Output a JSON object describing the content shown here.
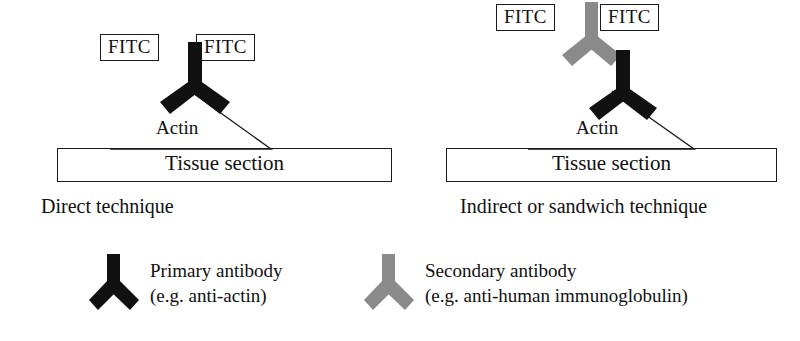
{
  "figure": {
    "type": "immunofluorescence-technique-diagram",
    "colors": {
      "primary_antibody": "#111111",
      "secondary_antibody": "#8a8a8a",
      "line": "#1a1a1a",
      "background": "#ffffff"
    }
  },
  "panels": [
    {
      "id": "direct",
      "caption": "Direct technique",
      "fitc_left": "FITC",
      "fitc_right": "FITC",
      "actin_label": "Actin",
      "tissue_label": "Tissue section",
      "antibodies": [
        {
          "name": "primary-antibody",
          "color": "#111111"
        }
      ]
    },
    {
      "id": "indirect",
      "caption": "Indirect or sandwich technique",
      "fitc_left": "FITC",
      "fitc_right": "FITC",
      "actin_label": "Actin",
      "tissue_label": "Tissue section",
      "antibodies": [
        {
          "name": "secondary-antibody",
          "color": "#8a8a8a"
        },
        {
          "name": "primary-antibody",
          "color": "#111111"
        }
      ]
    }
  ],
  "legend": {
    "items": [
      {
        "id": "primary",
        "color": "#111111",
        "line1": "Primary antibody",
        "line2": "(e.g. anti-actin)"
      },
      {
        "id": "secondary",
        "color": "#8a8a8a",
        "line1": "Secondary antibody",
        "line2": "(e.g. anti-human immunoglobulin)"
      }
    ]
  }
}
